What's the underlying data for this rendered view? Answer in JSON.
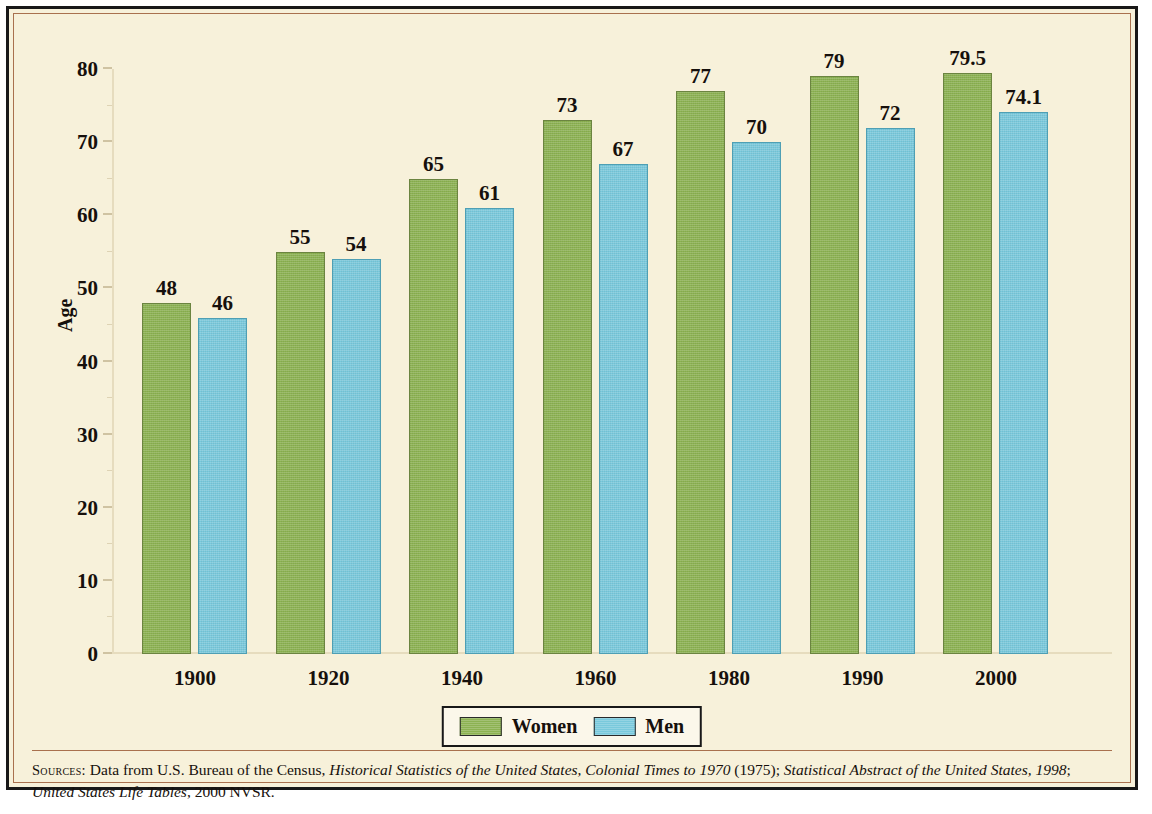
{
  "figure": {
    "background_color": "#F7F1DA",
    "frame_color": "#181818",
    "inner_rule_color": "#A9714E"
  },
  "chart_data": {
    "type": "bar",
    "title": "",
    "xlabel": "",
    "ylabel": "Age",
    "ylim": [
      0,
      80
    ],
    "ytick_step": 10,
    "grid": false,
    "legend_position": "bottom",
    "categories": [
      "1900",
      "1920",
      "1940",
      "1960",
      "1980",
      "1990",
      "2000"
    ],
    "ytick_labels": [
      "0",
      "10",
      "20",
      "30",
      "40",
      "50",
      "60",
      "70",
      "80"
    ],
    "series": [
      {
        "name": "Women",
        "color": "#8CB252",
        "values": [
          48,
          55,
          65,
          73,
          77,
          79,
          79.5
        ],
        "value_labels": [
          "48",
          "55",
          "65",
          "73",
          "77",
          "79",
          "79.5"
        ]
      },
      {
        "name": "Men",
        "color": "#79C9DC",
        "values": [
          46,
          54,
          61,
          67,
          70,
          72,
          74.1
        ],
        "value_labels": [
          "46",
          "54",
          "61",
          "67",
          "70",
          "72",
          "74.1"
        ]
      }
    ]
  },
  "sources": {
    "label": "Sources:",
    "line1_prefix": "Data from U.S. Bureau of the Census, ",
    "line1_italic1": "Historical Statistics of the United States, Colonial Times to 1970",
    "line1_mid": " (1975); ",
    "line1_italic2": "Statistical Abstract of the United States, 1998",
    "line1_suffix": ";",
    "line2_italic": "United States Life Tables",
    "line2_suffix": ", 2000 NVSR."
  }
}
